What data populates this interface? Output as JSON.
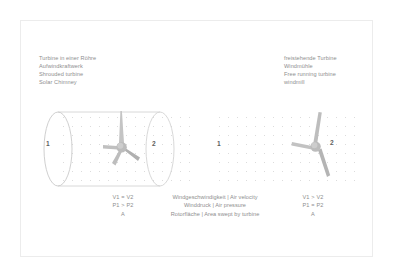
{
  "figure": {
    "background_color": "#ffffff",
    "frame_color": "#ececec",
    "text_color": "#8e8e8e",
    "blade_color": "#b7b7b7",
    "tube_color": "#d2d2d2",
    "dot_color": "#dcdcdc"
  },
  "left_panel": {
    "labels": {
      "line1": "Turbine in einer Röhre",
      "line2": "Aufwindkraftwerk",
      "line3": "Shrouded turbine",
      "line4": "Solar Chimney"
    },
    "station_inlet": "1",
    "station_outlet": "2",
    "formula": {
      "velocity": "V1 = V2",
      "pressure": "P1 > P2",
      "area": "A"
    }
  },
  "right_panel": {
    "labels": {
      "line1": "freistehende Turbine",
      "line2": "Windmühle",
      "line3": "Free running turbine",
      "line4": "windmill"
    },
    "station_inlet": "1",
    "station_outlet": "2",
    "formula": {
      "velocity": "V1 > V2",
      "pressure": "P1 = P2",
      "area": "A"
    }
  },
  "legend": {
    "line1": "Windgeschwindigkeit | Air velocity",
    "line2": "Winddruck | Air pressure",
    "line3": "Rotorfläche | Area swept by turbine"
  }
}
